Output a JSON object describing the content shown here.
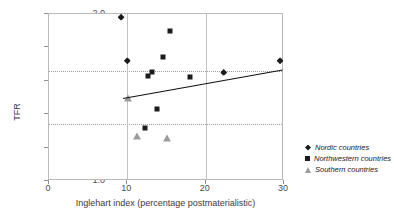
{
  "chart_data": {
    "type": "scatter",
    "title": "",
    "xlabel": "Inglehart index (percentage postmaterialistic)",
    "ylabel": "TFR",
    "xlim": [
      0,
      30
    ],
    "ylim": [
      1.0,
      2.0
    ],
    "xticks": [
      0,
      10,
      20,
      30
    ],
    "yticks": [
      "1.0",
      "1.2",
      "1.4",
      "1.6",
      "1.8",
      "2.0"
    ],
    "grid": "dotted horizontal at 1.66 and 1.34; solid vertical at x=10 and x=20",
    "gridlines_h": [
      1.66,
      1.34
    ],
    "gridlines_v": [
      10,
      20
    ],
    "legend_position": "right",
    "series": [
      {
        "name": "Nordic countries",
        "marker": "diamond",
        "color": "#1c1c1c",
        "points": [
          {
            "x": 9.2,
            "y": 1.98
          },
          {
            "x": 10.0,
            "y": 1.72
          },
          {
            "x": 22.3,
            "y": 1.65
          },
          {
            "x": 29.5,
            "y": 1.72
          }
        ]
      },
      {
        "name": "Northwestern countries",
        "marker": "square",
        "color": "#1c1c1c",
        "points": [
          {
            "x": 15.5,
            "y": 1.9
          },
          {
            "x": 14.6,
            "y": 1.74
          },
          {
            "x": 12.6,
            "y": 1.63
          },
          {
            "x": 13.2,
            "y": 1.65
          },
          {
            "x": 18.0,
            "y": 1.62
          },
          {
            "x": 13.8,
            "y": 1.43
          },
          {
            "x": 12.3,
            "y": 1.32
          }
        ]
      },
      {
        "name": "Southern countries",
        "marker": "triangle",
        "color": "#9b9b9b",
        "points": [
          {
            "x": 10.1,
            "y": 1.5
          },
          {
            "x": 11.2,
            "y": 1.27
          },
          {
            "x": 15.1,
            "y": 1.26
          }
        ]
      }
    ],
    "trendline": {
      "x_start": 9.5,
      "y_start": 1.5,
      "x_end": 29.8,
      "y_end": 1.67
    }
  },
  "axes": {
    "y_title": "TFR",
    "x_title": "Inglehart index (percentage postmaterialistic)",
    "x_tick_labels": [
      "0",
      "10",
      "20",
      "30"
    ],
    "y_tick_labels": [
      "1.0",
      "1.2",
      "1.4",
      "1.6",
      "1.8",
      "2.0"
    ]
  },
  "legend": {
    "entries": [
      {
        "label": "Nordic countries",
        "marker": "diamond-marker-icon"
      },
      {
        "label": "Northwestern countries",
        "marker": "square-marker-icon"
      },
      {
        "label": "Southern countries",
        "marker": "triangle-marker-icon"
      }
    ]
  }
}
